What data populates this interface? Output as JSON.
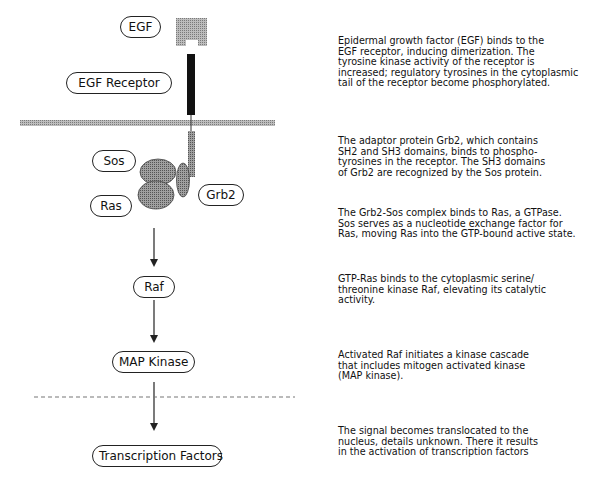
{
  "diagram": {
    "nodes": [
      {
        "id": "egf",
        "label": "EGF"
      },
      {
        "id": "egf_receptor",
        "label": "EGF Receptor"
      },
      {
        "id": "sos",
        "label": "Sos"
      },
      {
        "id": "ras",
        "label": "Ras"
      },
      {
        "id": "grb2",
        "label": "Grb2"
      },
      {
        "id": "raf",
        "label": "Raf"
      },
      {
        "id": "map_kinase",
        "label": "MAP Kinase"
      },
      {
        "id": "transcription_factors",
        "label": "Transcription Factors"
      }
    ],
    "edges": [
      {
        "from": "ras",
        "to": "raf"
      },
      {
        "from": "raf",
        "to": "map_kinase"
      },
      {
        "from": "map_kinase",
        "to": "transcription_factors"
      }
    ],
    "descriptions": [
      "Epidermal growth factor (EGF) binds to the\nEGF receptor, inducing dimerization.  The\ntyrosine kinase activity of the receptor is\nincreased; regulatory tyrosines in the cytoplasmic\ntail of the receptor become phosphorylated.",
      "The adaptor protein Grb2, which contains\nSH2 and SH3 domains, binds to phospho-\ntyrosines in the receptor.  The SH3 domains\nof Grb2 are recognized by the Sos protein.",
      "The Grb2-Sos complex binds to Ras, a GTPase.\nSos serves as a nucleotide exchange factor for\nRas, moving Ras into the GTP-bound active state.",
      "GTP-Ras binds to the cytoplasmic serine/\nthreonine kinase Raf, elevating its catalytic\nactivity.",
      "Activated Raf initiates a kinase cascade\nthat includes mitogen activated kinase\n(MAP kinase).",
      "The signal becomes translocated to the\nnucleus, details unknown.  There it results\nin the activation of transcription factors"
    ],
    "colors": {
      "membrane": "#c8c8c8",
      "receptor": "#111111",
      "protein_fill": "#9a9a9a",
      "ligand_fill": "#a8a8a8",
      "line": "#222222"
    }
  }
}
